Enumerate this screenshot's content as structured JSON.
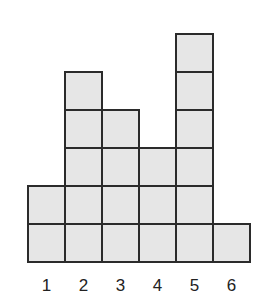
{
  "chart_data": {
    "type": "bar",
    "style": "stacked unit squares (dot-plot/histogram style)",
    "categories": [
      "1",
      "2",
      "3",
      "4",
      "5",
      "6"
    ],
    "values": [
      2,
      5,
      4,
      3,
      6,
      1
    ],
    "title": "",
    "xlabel": "",
    "ylabel": "",
    "ylim": [
      0,
      6
    ],
    "grid": false,
    "legend": null,
    "colors": {
      "fill": "#e6e6e6",
      "stroke": "#2b2b2b"
    }
  }
}
